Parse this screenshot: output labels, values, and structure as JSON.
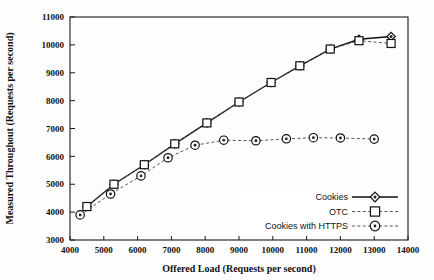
{
  "chart_data": {
    "type": "line",
    "title": "",
    "xlabel": "Offered Load (Requests per second)",
    "ylabel": "Measured Throughout (Requests per second)",
    "xlim": [
      4000,
      14000
    ],
    "ylim": [
      3000,
      11000
    ],
    "xticks": [
      4000,
      5000,
      6000,
      7000,
      8000,
      9000,
      10000,
      11000,
      12000,
      13000,
      14000
    ],
    "yticks": [
      3000,
      4000,
      5000,
      6000,
      7000,
      8000,
      9000,
      10000,
      11000
    ],
    "grid": false,
    "legend_position": "bottom-right",
    "series": [
      {
        "name": "Cookies",
        "marker": "diamond",
        "line": "solid",
        "x": [
          4500,
          5300,
          6200,
          7100,
          8050,
          9000,
          9950,
          10800,
          11700,
          12550,
          13500
        ],
        "values": [
          4200,
          5000,
          5700,
          6450,
          7200,
          7950,
          8650,
          9250,
          9850,
          10200,
          10300
        ]
      },
      {
        "name": "OTC",
        "marker": "square",
        "line": "dashed",
        "x": [
          4500,
          5300,
          6200,
          7100,
          8050,
          9000,
          9950,
          10800,
          11700,
          12550,
          13500
        ],
        "values": [
          4200,
          5000,
          5700,
          6450,
          7200,
          7950,
          8650,
          9250,
          9850,
          10150,
          10050
        ]
      },
      {
        "name": "Cookies with HTTPS",
        "marker": "circle",
        "line": "dashed",
        "x": [
          4300,
          5200,
          6100,
          6900,
          7700,
          8550,
          9500,
          10400,
          11200,
          12000,
          13000
        ],
        "values": [
          3900,
          4650,
          5300,
          5950,
          6400,
          6580,
          6560,
          6630,
          6670,
          6660,
          6620
        ]
      }
    ]
  },
  "colors": {
    "foreground": "#111111",
    "dashed": "#555555",
    "background": "#fdfdfd"
  }
}
